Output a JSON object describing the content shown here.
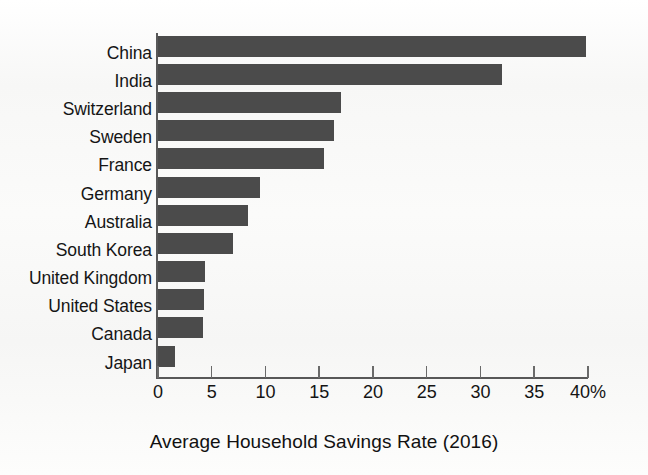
{
  "chart_data": {
    "type": "bar",
    "orientation": "horizontal",
    "title": "",
    "xlabel": "Average Household Savings Rate (2016)",
    "ylabel": "",
    "categories": [
      "China",
      "India",
      "Switzerland",
      "Sweden",
      "France",
      "Germany",
      "Australia",
      "South Korea",
      "United Kingdom",
      "United States",
      "Canada",
      "Japan"
    ],
    "values": [
      39.8,
      32.0,
      17.0,
      16.4,
      15.4,
      9.5,
      8.4,
      7.0,
      4.4,
      4.3,
      4.2,
      1.6
    ],
    "xlim": [
      0,
      40
    ],
    "xticks": [
      0,
      5,
      10,
      15,
      20,
      25,
      30,
      35,
      40
    ],
    "xtick_labels": [
      "0",
      "5",
      "10",
      "15",
      "20",
      "25",
      "30",
      "35",
      "40%"
    ],
    "unit": "%",
    "grid": false,
    "legend": false,
    "bar_color": "#4b4b4b",
    "axis_color": "#585858",
    "background_color": "#fafaf9"
  }
}
